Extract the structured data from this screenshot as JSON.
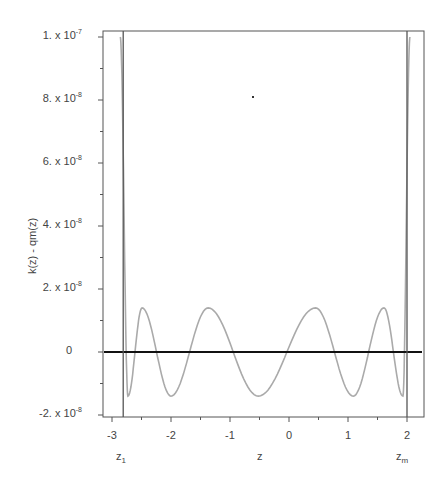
{
  "chart_data": {
    "type": "line",
    "title": "",
    "xlabel": "z",
    "ylabel": "k(z) - qm(z)",
    "xlim": [
      -3.15,
      2.3
    ],
    "ylim": [
      -2.1e-08,
      1e-07
    ],
    "x_ticks": [
      -3,
      -2,
      -1,
      0,
      1,
      2
    ],
    "x_tick_labels": [
      "-3",
      "-2",
      "-1",
      "0",
      "1",
      "2"
    ],
    "y_ticks": [
      -2e-08,
      0,
      2e-08,
      4e-08,
      6e-08,
      8e-08,
      1e-07
    ],
    "y_tick_labels": [
      {
        "mant": "-2.",
        "exp": "-8"
      },
      {
        "mant": "0",
        "exp": ""
      },
      {
        "mant": "2.",
        "exp": "-8"
      },
      {
        "mant": "4.",
        "exp": "-8"
      },
      {
        "mant": "6.",
        "exp": "-8"
      },
      {
        "mant": "8.",
        "exp": "-8"
      },
      {
        "mant": "1.",
        "exp": "-7"
      }
    ],
    "grid": false,
    "annotations": {
      "z1": {
        "label": "z",
        "sub": "1",
        "x": -2.81
      },
      "zm": {
        "label": "z",
        "sub": "m",
        "x": 2.0
      }
    },
    "series": [
      {
        "name": "k(z) - qm(z)",
        "color": "#aaaaaa",
        "extrema": [
          {
            "z": -2.86,
            "y": 1e-07
          },
          {
            "z": -2.73,
            "y": -1.4e-08
          },
          {
            "z": -2.49,
            "y": 1.4e-08
          },
          {
            "z": -2.0,
            "y": -1.4e-08
          },
          {
            "z": -1.37,
            "y": 1.4e-08
          },
          {
            "z": -0.52,
            "y": -1.4e-08
          },
          {
            "z": 0.45,
            "y": 1.4e-08
          },
          {
            "z": 1.09,
            "y": -1.4e-08
          },
          {
            "z": 1.61,
            "y": 1.4e-08
          },
          {
            "z": 1.93,
            "y": -1.4e-08
          },
          {
            "z": 2.05,
            "y": 1e-07
          }
        ]
      },
      {
        "name": "zero-line",
        "color": "#111111",
        "y": 0
      },
      {
        "name": "z1-line",
        "color": "#555555",
        "x": -2.81
      },
      {
        "name": "zm-line",
        "color": "#555555",
        "x": 2.0
      }
    ]
  }
}
